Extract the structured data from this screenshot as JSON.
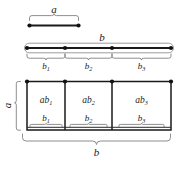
{
  "figure": {
    "colors": {
      "ink": "#1a1a1a",
      "brace": "#7a7a7a",
      "capsule": "#8a8a8a",
      "background": "#ffffff"
    },
    "segment_a": {
      "label": "a",
      "endpoints": 2
    },
    "segment_b": {
      "label": "b",
      "parts": [
        {
          "base": "b",
          "index": "1"
        },
        {
          "base": "b",
          "index": "2"
        },
        {
          "base": "b",
          "index": "3"
        }
      ],
      "endpoints": 4
    },
    "rectangle": {
      "height_label": "a",
      "width_label": "b",
      "cells": [
        {
          "area": {
            "base": "ab",
            "index": "1"
          },
          "width": {
            "base": "b",
            "index": "1"
          }
        },
        {
          "area": {
            "base": "ab",
            "index": "2"
          },
          "width": {
            "base": "b",
            "index": "2"
          }
        },
        {
          "area": {
            "base": "ab",
            "index": "3"
          },
          "width": {
            "base": "b",
            "index": "3"
          }
        }
      ],
      "corner_dots": 4
    }
  }
}
